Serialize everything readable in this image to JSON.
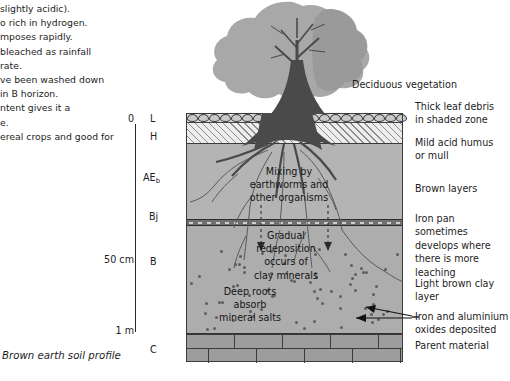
{
  "page": {
    "caption": "Brown earth soil profile"
  },
  "left_text": {
    "lines": [
      "slightly acidic).",
      "o rich in hydrogen.",
      "mposes rapidly.",
      "bleached as rainfall",
      "rate.",
      "ve been washed down",
      " in B horizon.",
      "ntent gives it a",
      "e.",
      "ereal crops and good for"
    ]
  },
  "scale": {
    "top_label": "0",
    "mid_label": "50 cm",
    "bottom_label": "1 m"
  },
  "horizons": [
    {
      "key": "L",
      "label": "L",
      "sub": ""
    },
    {
      "key": "H",
      "label": "H",
      "sub": ""
    },
    {
      "key": "AEb",
      "label": "AE",
      "sub": "b"
    },
    {
      "key": "Bj",
      "label": "Bj",
      "sub": ""
    },
    {
      "key": "B",
      "label": "B",
      "sub": ""
    },
    {
      "key": "C",
      "label": "C",
      "sub": ""
    }
  ],
  "annotations_right": [
    {
      "name": "deciduous-vegetation",
      "text": "Deciduous vegetation"
    },
    {
      "name": "thick-leaf-debris",
      "line1": "Thick leaf debris",
      "line2": "in shaded zone"
    },
    {
      "name": "mild-acid-humus",
      "line1": "Mild acid humus",
      "line2": "or mull"
    },
    {
      "name": "brown-layers",
      "line1": "Brown layers",
      "line2": ""
    },
    {
      "name": "iron-pan",
      "line1": "Iron pan sometimes",
      "line2": "develops where",
      "line3": "there is more",
      "line4": "leaching"
    },
    {
      "name": "light-brown-clay",
      "line1": "Light brown clay",
      "line2": "layer"
    },
    {
      "name": "iron-aluminium-oxides",
      "line1": "Iron and aluminium",
      "line2": "oxides deposited"
    },
    {
      "name": "parent-material",
      "line1": "Parent material",
      "line2": ""
    }
  ],
  "annotations_inner": [
    {
      "name": "mixing-by-earthworms",
      "line1": "Mixing by",
      "line2": "earthworms and",
      "line3": "other organisms"
    },
    {
      "name": "gradual-redeposition",
      "line1": "Gradual",
      "line2": "redeposition",
      "line3": "occurs of",
      "line4": "clay minerals"
    },
    {
      "name": "deep-roots",
      "line1": "Deep roots",
      "line2": "absorb",
      "line3": "mineral salts"
    }
  ],
  "colors": {
    "background": "#ffffff",
    "text": "#1d1d1d",
    "tree_canopy": "#a8a8a8",
    "tree_trunk": "#4a4a4a",
    "layer_L": "#d8d8d8",
    "layer_H": "#ededed",
    "layer_AEb": "#b4b4b4",
    "layer_Bj": "#6f6f6f",
    "layer_B": "#adadad",
    "layer_C": "#9d9d9d",
    "outline": "#3b3b3b"
  }
}
